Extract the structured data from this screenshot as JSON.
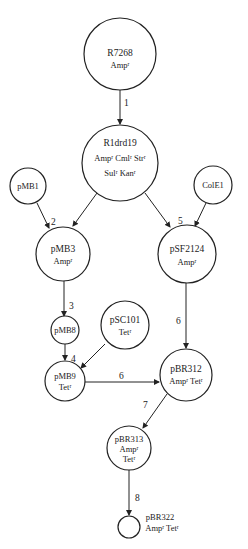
{
  "nodes": {
    "r7268": {
      "name": "R7268",
      "markers": "Ampʳ"
    },
    "r1drd19": {
      "name": "R1drd19",
      "markers_line1": "Ampʳ  Cmlʳ  Strʳ",
      "markers_line2": "Sulʳ  Kanʳ"
    },
    "pmb1": {
      "name": "pMB1"
    },
    "cole1": {
      "name": "ColE1"
    },
    "pmb3": {
      "name": "pMB3",
      "markers": "Ampʳ"
    },
    "psf2124": {
      "name": "pSF2124",
      "markers": "Ampʳ"
    },
    "pmb8": {
      "name": "pMB8"
    },
    "psc101": {
      "name": "pSC101",
      "markers": "Tetʳ"
    },
    "pmb9": {
      "name": "pMB9",
      "markers": "Tetʳ"
    },
    "pbr312": {
      "name": "pBR312",
      "markers": "Ampʳ  Tetʳ"
    },
    "pbr313": {
      "name": "pBR313",
      "markers_line1": "Ampʳ",
      "markers_line2": "Tetʳ"
    },
    "pbr322": {
      "name": "pBR322",
      "markers": "Ampʳ   Tetʳ"
    }
  },
  "steps": {
    "s1": "1",
    "s2": "2",
    "s3": "3",
    "s4": "4",
    "s5": "5",
    "s6a": "6",
    "s6b": "6",
    "s7": "7",
    "s8": "8"
  },
  "edges": [
    {
      "from": "R7268",
      "to": "R1drd19",
      "step": "1"
    },
    {
      "from": "R1drd19",
      "to": "pMB3",
      "step": "2"
    },
    {
      "from": "pMB1",
      "to": "pMB3",
      "step": "2"
    },
    {
      "from": "R1drd19",
      "to": "pSF2124",
      "step": "5"
    },
    {
      "from": "ColE1",
      "to": "pSF2124",
      "step": "5"
    },
    {
      "from": "pMB3",
      "to": "pMB8",
      "step": "3"
    },
    {
      "from": "pMB8",
      "to": "pMB9",
      "step": "4"
    },
    {
      "from": "pSC101",
      "to": "pMB9",
      "step": "4"
    },
    {
      "from": "pMB9",
      "to": "pBR312",
      "step": "6"
    },
    {
      "from": "pSF2124",
      "to": "pBR312",
      "step": "6"
    },
    {
      "from": "pBR312",
      "to": "pBR313",
      "step": "7"
    },
    {
      "from": "pBR313",
      "to": "pBR322",
      "step": "8"
    }
  ]
}
